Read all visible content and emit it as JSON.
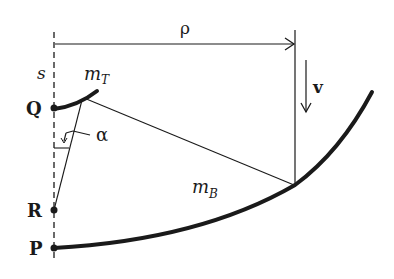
{
  "diagram": {
    "labels": {
      "rho": "ρ",
      "v": "v",
      "s": "s",
      "m_T": "m",
      "m_T_sub": "T",
      "m_B": "m",
      "m_B_sub": "B",
      "alpha": "α",
      "Q": "Q",
      "R": "R",
      "P": "P"
    },
    "colors": {
      "ink": "#1a1a1a",
      "background": "#ffffff"
    },
    "elements": [
      "dashed vertical axis s",
      "horizontal distance arrow rho",
      "vertical reference line at rho",
      "velocity arrow v",
      "short thick curve m_T starting at Q",
      "long thick curve m_B starting at P",
      "thin line from m_T to m_B intersection",
      "thin line from m_T to R",
      "right-angle mark with angle alpha",
      "points Q, R, P on axis"
    ]
  }
}
